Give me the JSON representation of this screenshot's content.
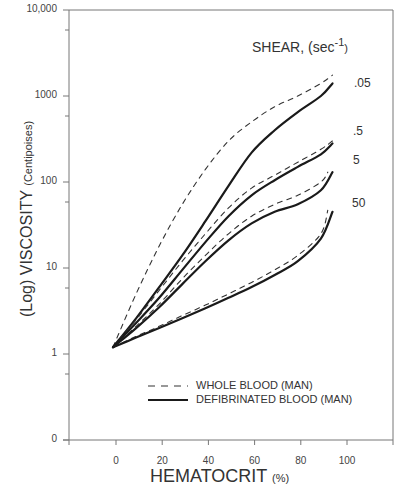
{
  "chart_data": {
    "type": "line",
    "title": "",
    "xlabel": "HEMATOCRIT",
    "xlabel_unit": "(%)",
    "ylabel": "(Log) VISCOSITY",
    "ylabel_unit": "(Centipoises)",
    "yscale": "log",
    "xlim": [
      -20,
      120
    ],
    "ylim": [
      0.1,
      10000
    ],
    "x_ticks": [
      "0",
      "20",
      "40",
      "60",
      "80",
      "100"
    ],
    "y_ticks": [
      "10,000",
      "1000",
      "100",
      "10",
      "1",
      "0"
    ],
    "grid": false,
    "annotation_title": "SHEAR, (sec",
    "annotation_exp": "-1",
    "annotation_close": ")",
    "legend": {
      "position": "lower-right",
      "entries": [
        {
          "label": "WHOLE BLOOD (MAN)",
          "style": "dashed"
        },
        {
          "label": "DEFIBRINATED BLOOD (MAN)",
          "style": "solid"
        }
      ]
    },
    "shear_labels": [
      ".05",
      ".5",
      "5",
      "50"
    ],
    "series": [
      {
        "name": "Whole blood, shear .05",
        "style": "dashed",
        "shear": ".05",
        "x": [
          0,
          10,
          20,
          30,
          40,
          50,
          60,
          70,
          80,
          90,
          95
        ],
        "y": [
          1.2,
          5,
          18,
          55,
          140,
          300,
          500,
          750,
          1000,
          1400,
          1750
        ]
      },
      {
        "name": "Defibrinated blood, shear .05",
        "style": "solid",
        "shear": ".05",
        "x": [
          0,
          10,
          20,
          30,
          40,
          50,
          60,
          70,
          80,
          90,
          95
        ],
        "y": [
          1.2,
          2.6,
          6,
          14,
          35,
          90,
          220,
          400,
          650,
          1000,
          1400
        ]
      },
      {
        "name": "Whole blood, shear .5",
        "style": "dashed",
        "shear": ".5",
        "x": [
          0,
          10,
          20,
          30,
          40,
          50,
          60,
          70,
          80,
          90,
          95
        ],
        "y": [
          1.2,
          2.5,
          5.5,
          12,
          25,
          50,
          85,
          120,
          170,
          240,
          300
        ]
      },
      {
        "name": "Defibrinated blood, shear .5",
        "style": "solid",
        "shear": ".5",
        "x": [
          0,
          10,
          20,
          30,
          40,
          50,
          60,
          70,
          80,
          90,
          95
        ],
        "y": [
          1.2,
          2.3,
          4.5,
          9.5,
          20,
          40,
          70,
          105,
          150,
          210,
          280
        ]
      },
      {
        "name": "Whole blood, shear 5",
        "style": "dashed",
        "shear": "5",
        "x": [
          0,
          10,
          20,
          30,
          40,
          50,
          60,
          70,
          80,
          90,
          93
        ],
        "y": [
          1.2,
          2.1,
          3.8,
          7.5,
          14,
          25,
          40,
          55,
          70,
          100,
          130
        ]
      },
      {
        "name": "Defibrinated blood, shear 5",
        "style": "solid",
        "shear": "5",
        "x": [
          0,
          10,
          20,
          30,
          40,
          50,
          60,
          70,
          80,
          90,
          95
        ],
        "y": [
          1.2,
          2.0,
          3.5,
          6.5,
          12,
          21,
          33,
          45,
          55,
          80,
          130
        ]
      },
      {
        "name": "Whole blood, shear 50",
        "style": "dashed",
        "shear": "50",
        "x": [
          0,
          10,
          20,
          30,
          40,
          50,
          60,
          70,
          80,
          90,
          93
        ],
        "y": [
          1.2,
          1.6,
          2.1,
          2.8,
          3.7,
          5,
          6.8,
          9.5,
          14,
          25,
          47
        ]
      },
      {
        "name": "Defibrinated blood, shear 50",
        "style": "solid",
        "shear": "50",
        "x": [
          0,
          10,
          20,
          30,
          40,
          50,
          60,
          70,
          80,
          90,
          95
        ],
        "y": [
          1.2,
          1.55,
          2.0,
          2.6,
          3.4,
          4.5,
          6.0,
          8.3,
          12,
          22,
          45
        ]
      }
    ]
  }
}
